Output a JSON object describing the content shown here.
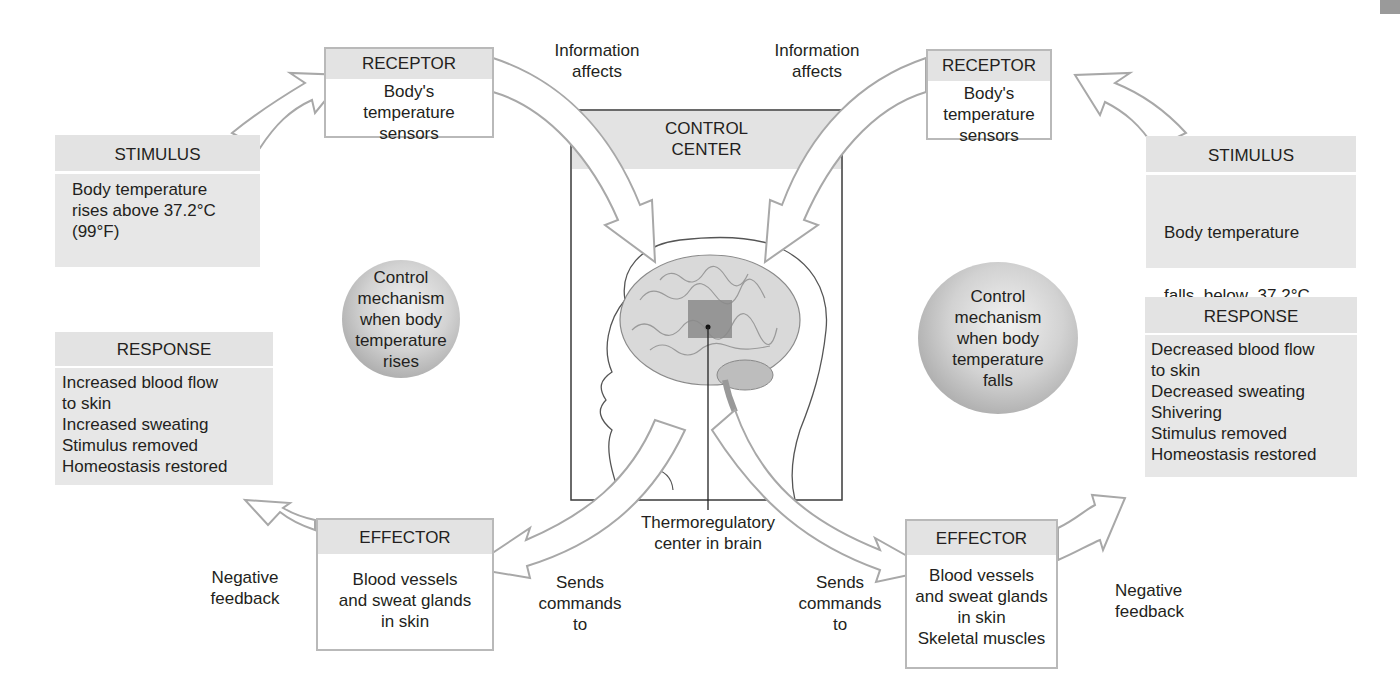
{
  "left": {
    "stimulus": {
      "title": "STIMULUS",
      "lines": [
        "Body temperature",
        "rises above 37.2°C",
        "(99°F)"
      ]
    },
    "receptor": {
      "title": "RECEPTOR",
      "lines": [
        "Body's",
        "temperature",
        "sensors"
      ]
    },
    "info_label": [
      "Information",
      "affects"
    ],
    "mechanism": [
      "Control",
      "mechanism",
      "when body",
      "temperature",
      "rises"
    ],
    "response": {
      "title": "RESPONSE",
      "lines": [
        "Increased blood flow",
        "to skin",
        "Increased sweating",
        "Stimulus removed",
        "Homeostasis restored"
      ]
    },
    "effector": {
      "title": "EFFECTOR",
      "lines": [
        "Blood vessels",
        "and sweat glands",
        "in skin"
      ]
    },
    "feedback_label": [
      "Negative",
      "feedback"
    ],
    "commands_label": [
      "Sends",
      "commands",
      "to"
    ]
  },
  "center": {
    "title": [
      "CONTROL",
      "CENTER"
    ],
    "caption": [
      "Thermoregulatory",
      "center in brain"
    ]
  },
  "right": {
    "stimulus": {
      "title": "STIMULUS",
      "lines": [
        "Body temperature",
        "falls  below  37.2°C",
        "(99°F)"
      ]
    },
    "receptor": {
      "title": "RECEPTOR",
      "lines": [
        "Body's",
        "temperature",
        "sensors"
      ]
    },
    "info_label": [
      "Information",
      "affects"
    ],
    "mechanism": [
      "Control",
      "mechanism",
      "when body",
      "temperature",
      "falls"
    ],
    "response": {
      "title": "RESPONSE",
      "lines": [
        "Decreased blood flow",
        "to skin",
        "Decreased sweating",
        "Shivering",
        "Stimulus removed",
        "Homeostasis restored"
      ]
    },
    "effector": {
      "title": "EFFECTOR",
      "lines": [
        "Blood vessels",
        "and sweat glands",
        "in skin",
        "Skeletal muscles"
      ]
    },
    "feedback_label": [
      "Negative",
      "feedback"
    ],
    "commands_label": [
      "Sends",
      "commands",
      "to"
    ]
  },
  "colors": {
    "box_header": "#e3e3e3",
    "box_body_gray": "#e7e7e7",
    "box_border": "#b9b9b9",
    "arrow_stroke": "#a8a8a8",
    "target_square": "#8a8a8a"
  }
}
